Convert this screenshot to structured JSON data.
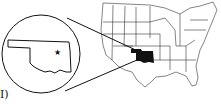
{
  "figure": {
    "panel_label": "I)",
    "main_map": "United States",
    "highlighted_state": "Oklahoma",
    "inset": {
      "shape": "Oklahoma outline",
      "marker": "star"
    },
    "colors": {
      "ink": "#111111",
      "highlight": "#111111",
      "background": "#ffffff"
    }
  }
}
